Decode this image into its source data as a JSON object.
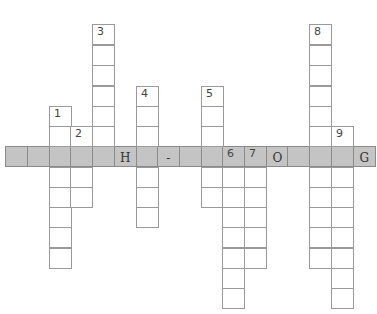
{
  "puzzle": {
    "type": "crossword",
    "cell_size": 21.7,
    "col_x": [
      5,
      27,
      49,
      70,
      92,
      114,
      136,
      157,
      179,
      201,
      222,
      244,
      266,
      287,
      309,
      331,
      353
    ],
    "row_y": [
      24,
      45,
      65,
      86,
      106,
      126,
      146,
      167,
      187,
      207,
      227,
      248,
      268,
      288
    ],
    "row_h": 20.4,
    "colors": {
      "highlight": "#c4c4c4",
      "border": "#9a9a9a",
      "cell": "#ffffff"
    },
    "highlight_row": {
      "row": 6,
      "cells": [
        "",
        "",
        "",
        "",
        "",
        "H",
        "",
        "-",
        "",
        "",
        "",
        "",
        "O",
        "",
        "",
        "",
        "G"
      ]
    },
    "down_words": [
      {
        "number": "1",
        "col": 2,
        "start_row": 4,
        "end_row": 11,
        "number_row": 4
      },
      {
        "number": "2",
        "col": 3,
        "start_row": 5,
        "end_row": 8,
        "number_row": 5
      },
      {
        "number": "3",
        "col": 4,
        "start_row": 0,
        "end_row": 6,
        "number_row": 0
      },
      {
        "number": "4",
        "col": 6,
        "start_row": 3,
        "end_row": 9,
        "number_row": 3
      },
      {
        "number": "5",
        "col": 9,
        "start_row": 3,
        "end_row": 8,
        "number_row": 3
      },
      {
        "number": "6",
        "col": 10,
        "start_row": 6,
        "end_row": 13,
        "number_row": 6
      },
      {
        "number": "7",
        "col": 11,
        "start_row": 6,
        "end_row": 11,
        "number_row": 6
      },
      {
        "number": "8",
        "col": 14,
        "start_row": 0,
        "end_row": 11,
        "number_row": 0
      },
      {
        "number": "9",
        "col": 15,
        "start_row": 5,
        "end_row": 13,
        "number_row": 5
      }
    ]
  }
}
